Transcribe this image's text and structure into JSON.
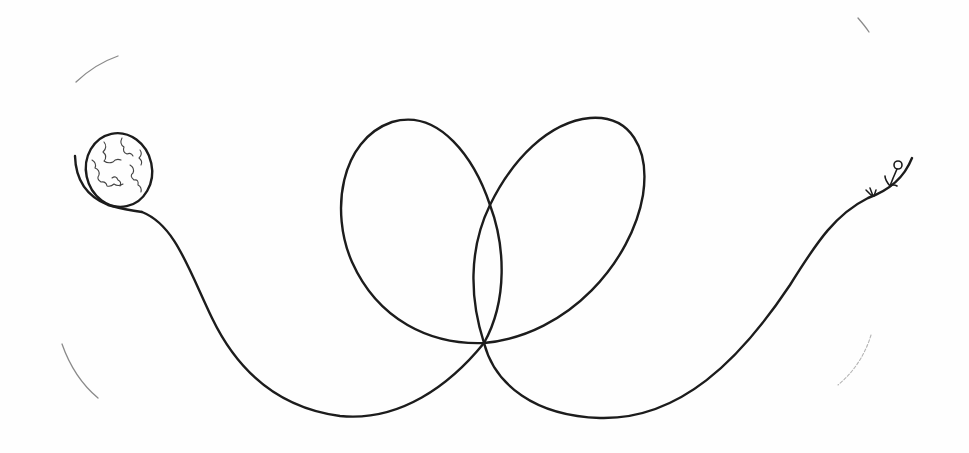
{
  "artwork": {
    "title": "Hand-drawn pencil sketch",
    "description": "A globe on the left connected by a long looping line that forms two overlapping loops to a small figure standing on curved ground at the right",
    "colors": {
      "paper": "#fefefe",
      "ink": "#1c1c1c",
      "faint_ink": "#8a8a8a"
    },
    "elements": [
      {
        "name": "globe",
        "shape": "ellipse",
        "position": [
          118,
          170
        ]
      },
      {
        "name": "looping-line",
        "shape": "path"
      },
      {
        "name": "left-loop",
        "shape": "loop"
      },
      {
        "name": "right-loop",
        "shape": "loop"
      },
      {
        "name": "stick-figure",
        "shape": "figure",
        "position": [
          893,
          175
        ]
      },
      {
        "name": "corner-arcs",
        "shape": "faint-arcs",
        "count": 4
      }
    ]
  }
}
